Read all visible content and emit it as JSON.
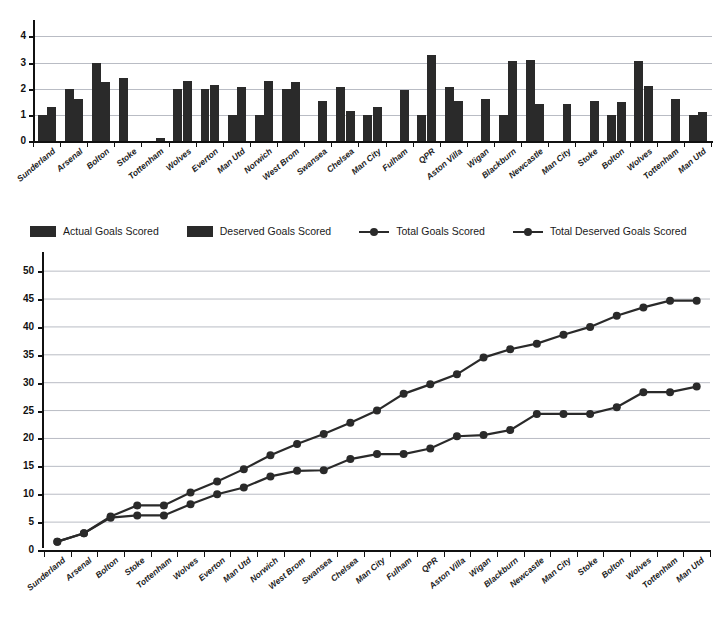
{
  "legend": {
    "items": [
      {
        "label": "Actual Goals Scored",
        "type": "bar",
        "color": "#2a2a2a"
      },
      {
        "label": "Deserved Goals Scored",
        "type": "bar",
        "color": "#2a2a2a"
      },
      {
        "label": "Total Goals Scored",
        "type": "line",
        "color": "#2a2a2a"
      },
      {
        "label": "Total Deserved Goals Scored",
        "type": "line",
        "color": "#2a2a2a"
      }
    ]
  },
  "chart_data": [
    {
      "type": "bar",
      "title": "",
      "xlabel": "",
      "ylabel": "",
      "ylim": [
        0,
        4.4
      ],
      "yticks": [
        0,
        1,
        2,
        3,
        4
      ],
      "grid": true,
      "legend_position": "below",
      "categories": [
        "Sunderland",
        "Arsenal",
        "Bolton",
        "Stoke",
        "Tottenham",
        "Wolves",
        "Everton",
        "Man Utd",
        "Norwich",
        "West Brom",
        "Swansea",
        "Chelsea",
        "Man City",
        "Fulham",
        "QPR",
        "Aston Villa",
        "Wigan",
        "Blackburn",
        "Newcastle",
        "Man City",
        "Stoke",
        "Bolton",
        "Wolves",
        "Tottenham",
        "Man Utd"
      ],
      "series": [
        {
          "name": "Actual Goals Scored",
          "values": [
            1.0,
            2.0,
            3.0,
            2.4,
            0.0,
            2.0,
            2.0,
            1.0,
            1.0,
            2.0,
            0.0,
            2.05,
            1.0,
            0.0,
            1.0,
            2.05,
            0.0,
            1.0,
            3.1,
            0.0,
            0.0,
            1.0,
            3.05,
            0.0,
            1.0
          ]
        },
        {
          "name": "Deserved Goals Scored",
          "values": [
            1.3,
            1.6,
            2.25,
            0.0,
            0.1,
            2.3,
            2.15,
            2.05,
            2.3,
            2.25,
            1.55,
            1.15,
            1.3,
            1.95,
            3.3,
            1.55,
            1.6,
            3.05,
            1.4,
            1.4,
            1.55,
            1.5,
            2.1,
            1.6,
            1.1
          ]
        }
      ]
    },
    {
      "type": "line",
      "title": "",
      "xlabel": "",
      "ylabel": "",
      "ylim": [
        0,
        52
      ],
      "yticks": [
        0,
        5,
        10,
        15,
        20,
        25,
        30,
        35,
        40,
        45,
        50
      ],
      "grid": true,
      "legend_position": "above",
      "categories": [
        "Sunderland",
        "Arsenal",
        "Bolton",
        "Stoke",
        "Tottenham",
        "Wolves",
        "Everton",
        "Man Utd",
        "Norwich",
        "West Brom",
        "Swansea",
        "Chelsea",
        "Man City",
        "Fulham",
        "QPR",
        "Aston Villa",
        "Wigan",
        "Blackburn",
        "Newcastle",
        "Man City",
        "Stoke",
        "Bolton",
        "Wolves",
        "Tottenham",
        "Man Utd"
      ],
      "series": [
        {
          "name": "Total Goals Scored",
          "values": [
            1.5,
            3.0,
            6.0,
            8.0,
            8.0,
            10.3,
            12.3,
            14.5,
            17.0,
            19.0,
            20.8,
            22.8,
            25.0,
            28.0,
            29.7,
            31.5,
            34.5,
            36.0,
            37.0,
            38.6,
            40.0,
            42.0,
            43.5,
            44.7,
            44.7
          ]
        },
        {
          "name": "Total Deserved Goals Scored",
          "values": [
            1.5,
            3.0,
            5.8,
            6.2,
            6.2,
            8.2,
            10.0,
            11.2,
            13.2,
            14.2,
            14.3,
            16.3,
            17.2,
            17.2,
            18.2,
            20.4,
            20.6,
            21.5,
            24.4,
            24.4,
            24.4,
            25.6,
            28.3,
            28.3,
            29.3
          ]
        }
      ]
    }
  ]
}
